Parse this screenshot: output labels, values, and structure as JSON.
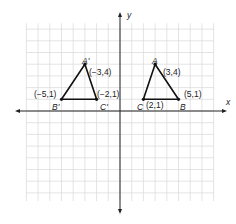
{
  "axes": {
    "x_label": "x",
    "y_label": "y"
  },
  "triangles": [
    {
      "name": "ABC",
      "vertices": [
        {
          "label": "A",
          "coord": "(3,4)"
        },
        {
          "label": "B",
          "coord": "(5,1)"
        },
        {
          "label": "C",
          "coord": "(2,1)"
        }
      ]
    },
    {
      "name": "A'B'C'",
      "vertices": [
        {
          "label": "A'",
          "coord": "(−3,4)"
        },
        {
          "label": "B'",
          "coord": "(−5,1)"
        },
        {
          "label": "C'",
          "coord": "(−2,1)"
        }
      ]
    }
  ],
  "colors": {
    "grid": "#d8d8d8",
    "axis": "#222222",
    "triangle": "#111111"
  }
}
